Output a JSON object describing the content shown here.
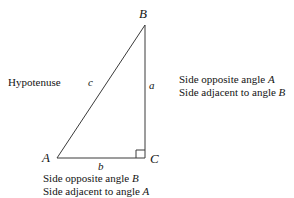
{
  "figure": {
    "type": "right-triangle-diagram",
    "background_color": "#ffffff",
    "stroke_color": "#3a3a3a",
    "text_color": "#141414"
  },
  "vertices": {
    "b": {
      "label": "B",
      "x": 145,
      "y": 25
    },
    "a": {
      "label": "A",
      "x": 57,
      "y": 158
    },
    "c": {
      "label": "C",
      "x": 145,
      "y": 158
    }
  },
  "sides": {
    "hypotenuse": {
      "label": "c",
      "from": "A",
      "to": "B"
    },
    "opposite_a": {
      "label": "a",
      "from": "B",
      "to": "C"
    },
    "base": {
      "label": "b",
      "from": "A",
      "to": "C"
    }
  },
  "right_angle": {
    "at_vertex": "C",
    "marker": "square",
    "size": 8
  },
  "annotations": {
    "hypotenuse": "Hypotenuse",
    "right_block": {
      "line1_prefix": "Side opposite angle ",
      "line1_var": "A",
      "line2_prefix": "Side adjacent to angle ",
      "line2_var": "B"
    },
    "bottom_block": {
      "line1_prefix": "Side opposite angle ",
      "line1_var": "B",
      "line2_prefix": "Side adjacent to angle ",
      "line2_var": "A"
    }
  }
}
